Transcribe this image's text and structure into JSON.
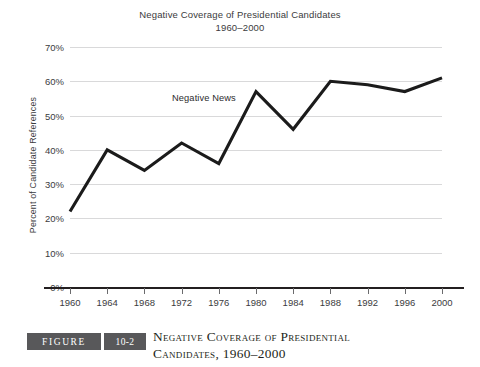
{
  "chart_data": {
    "type": "line",
    "title": "Negative Coverage of Presidential Candidates",
    "subtitle": "1960–2000",
    "xlabel": "",
    "ylabel": "Percent of Candidate References",
    "x": [
      1960,
      1964,
      1968,
      1972,
      1976,
      1980,
      1984,
      1988,
      1992,
      1996,
      2000
    ],
    "categories": [
      "1960",
      "1964",
      "1968",
      "1972",
      "1976",
      "1980",
      "1984",
      "1988",
      "1992",
      "1996",
      "2000"
    ],
    "series": [
      {
        "name": "Negative News",
        "values": [
          22,
          40,
          34,
          42,
          36,
          57,
          46,
          60,
          59,
          57,
          61
        ]
      }
    ],
    "ylim": [
      0,
      70
    ],
    "yticks": [
      0,
      10,
      20,
      30,
      40,
      50,
      60,
      70
    ],
    "ytick_labels": [
      "0%",
      "10%",
      "20%",
      "30%",
      "40%",
      "50%",
      "60%",
      "70%"
    ],
    "grid": true,
    "legend_position": "inline-annotation",
    "annotations": [
      {
        "text": "Negative News",
        "x": 1972,
        "y": 50
      }
    ],
    "line_color": "#1b1b1b",
    "gridline_color": "#d9d9da",
    "background_color": "#ffffff"
  },
  "caption": {
    "badge_label": "FIGURE",
    "badge_number": "10-2",
    "line1": "Negative Coverage of Presidential",
    "line2": "Candidates, 1960–2000",
    "badge_color": "#58585a"
  }
}
